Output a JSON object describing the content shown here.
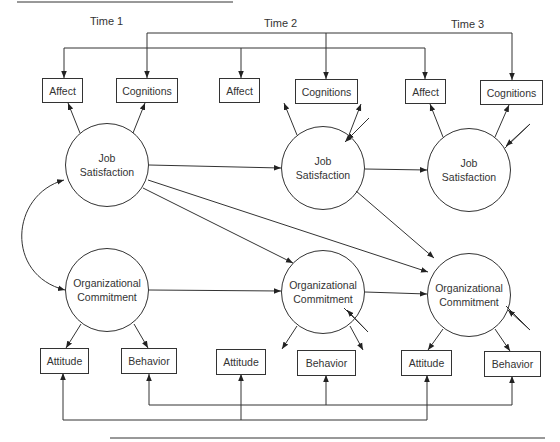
{
  "time_labels": [
    "Time 1",
    "Time 2",
    "Time 3"
  ],
  "latent": {
    "job_satisfaction": {
      "line1": "Job",
      "line2": "Satisfaction"
    },
    "organizational_commitment": {
      "line1": "Organizational",
      "line2": "Commitment"
    }
  },
  "indicators": {
    "affect": "Affect",
    "cognitions": "Cognitions",
    "attitude": "Attitude",
    "behavior": "Behavior"
  },
  "colors": {
    "stroke": "#333333",
    "background": "#ffffff"
  }
}
